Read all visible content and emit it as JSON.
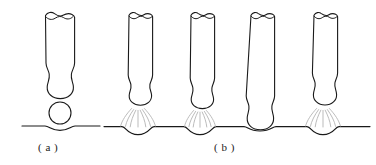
{
  "figure": {
    "background_color": "#ffffff",
    "outline_color": "#1a1a1a",
    "arc_color": "#b3b3b3",
    "panels": [
      {
        "id": "panel-a",
        "caption": "( a )",
        "description": "single electrode with detached droplet above workpiece",
        "electrode": {
          "x_left": 44,
          "x_right": 76,
          "top": 12,
          "bulb_bottom": 97
        },
        "droplet": {
          "cx": 60,
          "cy": 113,
          "r": 11
        },
        "baseline": {
          "y": 127,
          "x_start": 22,
          "x_end": 100,
          "depression": true
        }
      },
      {
        "id": "panel-b",
        "caption": "( b )",
        "description": "four electrodes in sequence showing arc and short-circuit transfer",
        "baseline": {
          "y": 127,
          "x_start": 104,
          "x_end": 370
        },
        "electrodes": [
          {
            "index": 1,
            "x_left": 128,
            "x_right": 148,
            "top": 12,
            "state": "arc",
            "arc_rays": 7
          },
          {
            "index": 2,
            "x_left": 190,
            "x_right": 210,
            "top": 12,
            "state": "arc",
            "arc_rays": 7
          },
          {
            "index": 3,
            "x_left": 250,
            "x_right": 270,
            "top": 12,
            "state": "short-circuit",
            "arc_rays": 0
          },
          {
            "index": 4,
            "x_left": 313,
            "x_right": 333,
            "top": 12,
            "state": "arc",
            "arc_rays": 7
          }
        ]
      }
    ]
  }
}
